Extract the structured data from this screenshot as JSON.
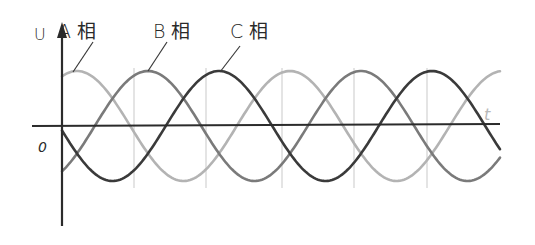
{
  "diagram": {
    "type": "three-phase-waveform",
    "axes": {
      "y_label": "U",
      "x_label": "t",
      "origin_label": "0",
      "origin": [
        62,
        126
      ],
      "y_axis_top": 22,
      "y_axis_bottom": 226,
      "x_axis_left": 32,
      "x_axis_right": 500,
      "axis_color": "#2b2b2b"
    },
    "grid": {
      "vertical_lines_x": [
        134,
        206,
        282,
        354,
        427
      ],
      "color": "#d6d6d6",
      "top": 68,
      "bottom": 188
    },
    "wave": {
      "x_start": 62,
      "x_end": 500,
      "center_y": 126,
      "amplitude": 55,
      "period": 213
    },
    "phases": [
      {
        "name": "A",
        "label": "A 相",
        "color": "#b3b3b3",
        "phase_deg": 120,
        "label_pos": [
          58,
          38
        ],
        "leader": [
          [
            93,
            42
          ],
          [
            73,
            72
          ]
        ]
      },
      {
        "name": "B",
        "label": "B 相",
        "color": "#7a7a7a",
        "phase_deg": 0,
        "label_pos": [
          153,
          38
        ],
        "leader": [
          [
            167,
            42
          ],
          [
            148,
            71
          ]
        ]
      },
      {
        "name": "C",
        "label": "C 相",
        "color": "#3a3a3a",
        "phase_deg": -120,
        "label_pos": [
          230,
          38
        ],
        "leader": [
          [
            240,
            46
          ],
          [
            220,
            72
          ]
        ]
      }
    ]
  }
}
